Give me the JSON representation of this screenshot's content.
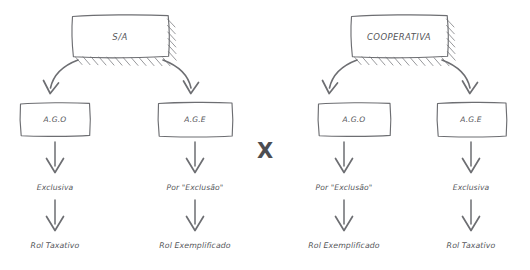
{
  "diagram": {
    "title_left": "S/A",
    "title_right": "COOPERATIVA",
    "divider_symbol": "X",
    "colors": {
      "background": "#ffffff",
      "stroke": "#6d6e72",
      "hatch": "#85868a",
      "text": "#55565a",
      "divider": "#4c4d51"
    },
    "groups": [
      {
        "id": "sa",
        "root_label": "S/A",
        "branches": [
          {
            "assembly": "A.G.O",
            "criterion": "Exclusiva",
            "outcome": "Rol Taxativo"
          },
          {
            "assembly": "A.G.E",
            "criterion": "Por \"Exclusão\"",
            "outcome": "Rol Exemplificado"
          }
        ]
      },
      {
        "id": "cooperativa",
        "root_label": "COOPERATIVA",
        "branches": [
          {
            "assembly": "A.G.O",
            "criterion": "Por \"Exclusão\"",
            "outcome": "Rol Exemplificado"
          },
          {
            "assembly": "A.G.E",
            "criterion": "Exclusiva",
            "outcome": "Rol Taxativo"
          }
        ]
      }
    ]
  }
}
